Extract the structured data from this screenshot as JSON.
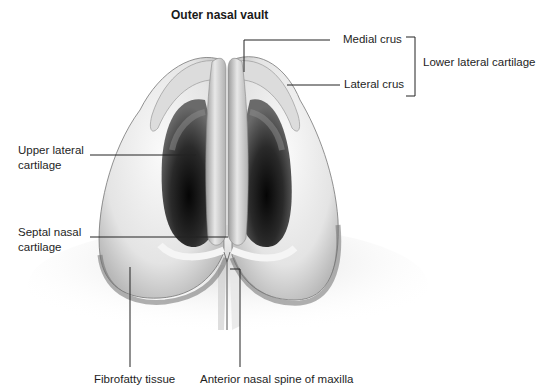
{
  "diagram": {
    "title": "Outer nasal vault",
    "labels": {
      "medial_crus": "Medial crus",
      "lateral_crus": "Lateral crus",
      "lower_lateral_cartilage": "Lower lateral cartilage",
      "upper_lateral_cartilage_line1": "Upper lateral",
      "upper_lateral_cartilage_line2": "cartilage",
      "septal_nasal_cartilage_line1": "Septal nasal",
      "septal_nasal_cartilage_line2": "cartilage",
      "fibrofatty_tissue": "Fibrofatty tissue",
      "anterior_nasal_spine": "Anterior nasal spine of maxilla"
    },
    "colors": {
      "background": "#ffffff",
      "cartilage_light": "#eeeeee",
      "cartilage_mid": "#bdbdbd",
      "shadow": "#8a8a8a",
      "nostril_dark": "#141414",
      "leader_line": "#222222"
    }
  }
}
